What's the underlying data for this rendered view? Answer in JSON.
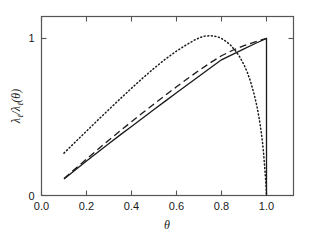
{
  "chart_data": {
    "type": "line",
    "title": "",
    "xlabel": "θ",
    "ylabel": "λℓ/λℓ(θ)",
    "ylabel_parts": {
      "lambda": "λ",
      "sub": "ℓ",
      "slash": "/",
      "theta_open": "(",
      "theta": "θ",
      "theta_close": ")"
    },
    "xlim": [
      0.0,
      1.12
    ],
    "ylim": [
      0.0,
      1.14
    ],
    "xticks": [
      0.0,
      0.2,
      0.4,
      0.6,
      0.8,
      1.0
    ],
    "xticklabels": [
      "0.0",
      "0.2",
      "0.4",
      "0.6",
      "0.8",
      "1.0"
    ],
    "yticks": [
      0,
      1
    ],
    "yticklabels": [
      "0",
      "1"
    ],
    "grid": false,
    "legend": "none",
    "frame": "box",
    "tick_direction": "in",
    "series": [
      {
        "name": "solid",
        "style": "solid",
        "color": "#1a1a1a",
        "points": [
          [
            0.1,
            0.105
          ],
          [
            0.15,
            0.163
          ],
          [
            0.2,
            0.22
          ],
          [
            0.25,
            0.276
          ],
          [
            0.3,
            0.331
          ],
          [
            0.35,
            0.386
          ],
          [
            0.4,
            0.44
          ],
          [
            0.45,
            0.494
          ],
          [
            0.5,
            0.548
          ],
          [
            0.55,
            0.601
          ],
          [
            0.6,
            0.654
          ],
          [
            0.65,
            0.707
          ],
          [
            0.7,
            0.76
          ],
          [
            0.75,
            0.812
          ],
          [
            0.8,
            0.864
          ],
          [
            0.85,
            0.899
          ],
          [
            0.9,
            0.934
          ],
          [
            0.95,
            0.968
          ],
          [
            1.0,
            1.0
          ],
          [
            1.0,
            0.0
          ]
        ]
      },
      {
        "name": "dashed",
        "style": "dashed",
        "color": "#1a1a1a",
        "points": [
          [
            0.1,
            0.108
          ],
          [
            0.15,
            0.17
          ],
          [
            0.2,
            0.232
          ],
          [
            0.25,
            0.293
          ],
          [
            0.3,
            0.353
          ],
          [
            0.35,
            0.412
          ],
          [
            0.4,
            0.47
          ],
          [
            0.45,
            0.527
          ],
          [
            0.5,
            0.583
          ],
          [
            0.55,
            0.638
          ],
          [
            0.6,
            0.692
          ],
          [
            0.65,
            0.745
          ],
          [
            0.7,
            0.796
          ],
          [
            0.75,
            0.845
          ],
          [
            0.8,
            0.89
          ],
          [
            0.85,
            0.925
          ],
          [
            0.9,
            0.954
          ],
          [
            0.95,
            0.979
          ],
          [
            1.0,
            1.0
          ]
        ]
      },
      {
        "name": "dotted",
        "style": "dotted",
        "color": "#1a1a1a",
        "points": [
          [
            0.1,
            0.27
          ],
          [
            0.15,
            0.34
          ],
          [
            0.2,
            0.41
          ],
          [
            0.25,
            0.48
          ],
          [
            0.3,
            0.548
          ],
          [
            0.35,
            0.616
          ],
          [
            0.4,
            0.683
          ],
          [
            0.45,
            0.748
          ],
          [
            0.5,
            0.81
          ],
          [
            0.55,
            0.868
          ],
          [
            0.6,
            0.92
          ],
          [
            0.65,
            0.965
          ],
          [
            0.68,
            0.99
          ],
          [
            0.7,
            1.003
          ],
          [
            0.72,
            1.014
          ],
          [
            0.75,
            1.018
          ],
          [
            0.78,
            1.012
          ],
          [
            0.8,
            1.0
          ],
          [
            0.82,
            0.982
          ],
          [
            0.84,
            0.958
          ],
          [
            0.86,
            0.926
          ],
          [
            0.88,
            0.885
          ],
          [
            0.9,
            0.833
          ],
          [
            0.915,
            0.784
          ],
          [
            0.93,
            0.722
          ],
          [
            0.945,
            0.646
          ],
          [
            0.958,
            0.565
          ],
          [
            0.968,
            0.487
          ],
          [
            0.976,
            0.41
          ],
          [
            0.983,
            0.33
          ],
          [
            0.988,
            0.253
          ],
          [
            0.992,
            0.18
          ],
          [
            0.996,
            0.105
          ],
          [
            0.999,
            0.035
          ],
          [
            1.0,
            0.0
          ]
        ]
      }
    ]
  }
}
